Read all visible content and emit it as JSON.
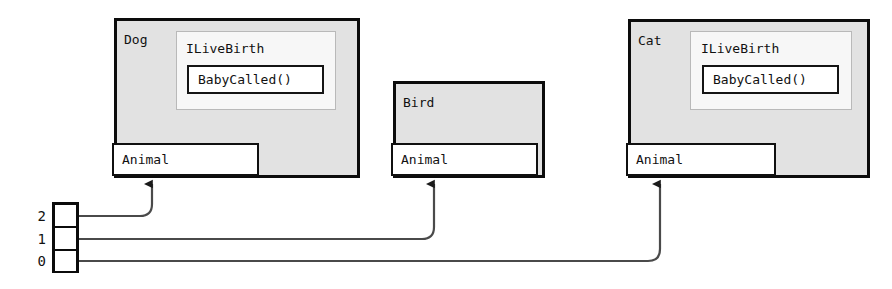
{
  "diagram": {
    "title": "",
    "colors": {
      "object_fill": "#e2e2e2",
      "object_border": "#0c0c0c",
      "interface_fill": "#f7f7f7",
      "interface_border": "#b9b9b9",
      "method_fill": "#ffffff",
      "method_border": "#141414",
      "base_fill": "#ffffff",
      "base_border": "#101010",
      "wire": "#4a4a4a",
      "page_background": "#ffffff"
    },
    "objects": [
      {
        "id": "dog",
        "name": "Dog",
        "interface": {
          "name": "ILiveBirth",
          "method": "BabyCalled()"
        },
        "base_class": "Animal"
      },
      {
        "id": "bird",
        "name": "Bird",
        "interface": null,
        "base_class": "Animal"
      },
      {
        "id": "cat",
        "name": "Cat",
        "interface": {
          "name": "ILiveBirth",
          "method": "BabyCalled()"
        },
        "base_class": "Animal"
      }
    ],
    "array": {
      "cells": [
        {
          "index": "2",
          "points_to": "Dog"
        },
        {
          "index": "1",
          "points_to": "Bird"
        },
        {
          "index": "0",
          "points_to": "Cat"
        }
      ]
    }
  }
}
